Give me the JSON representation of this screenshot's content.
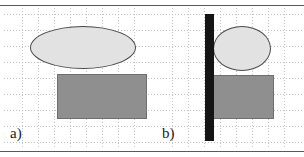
{
  "figure": {
    "width": 304,
    "height": 157,
    "background_color": "#ffffff",
    "frame_rule_color": "#5a5a5a",
    "grid": {
      "style": "dashed",
      "color": "#bdbdbd",
      "spacing_px": 16
    }
  },
  "panels": [
    {
      "id": "a",
      "label": "a)",
      "label_position": {
        "x": 10,
        "y": 126
      },
      "grid_origin": {
        "x": 22,
        "y": 14
      },
      "shapes": [
        {
          "name": "ellipse",
          "fill": "#e2e2e2",
          "stroke": "#4a4a4a",
          "x": 30,
          "y": 26,
          "width": 106,
          "height": 43
        },
        {
          "name": "rectangle",
          "fill": "#8f8f8f",
          "stroke": "#6f6f6f",
          "x": 57,
          "y": 74,
          "width": 90,
          "height": 45
        }
      ]
    },
    {
      "id": "b",
      "label": "b)",
      "label_position": {
        "x": 162,
        "y": 126
      },
      "grid_origin": {
        "x": 172,
        "y": 14
      },
      "shapes": [
        {
          "name": "vertical-bar",
          "fill": "#151515",
          "x": 205,
          "y": 14,
          "width": 9,
          "height": 127
        },
        {
          "name": "ellipse",
          "fill": "#e2e2e2",
          "stroke": "#4a4a4a",
          "x": 213,
          "y": 26,
          "width": 58,
          "height": 45
        },
        {
          "name": "rectangle",
          "fill": "#8f8f8f",
          "stroke": "#6f6f6f",
          "x": 213,
          "y": 75,
          "width": 61,
          "height": 44
        }
      ]
    }
  ]
}
